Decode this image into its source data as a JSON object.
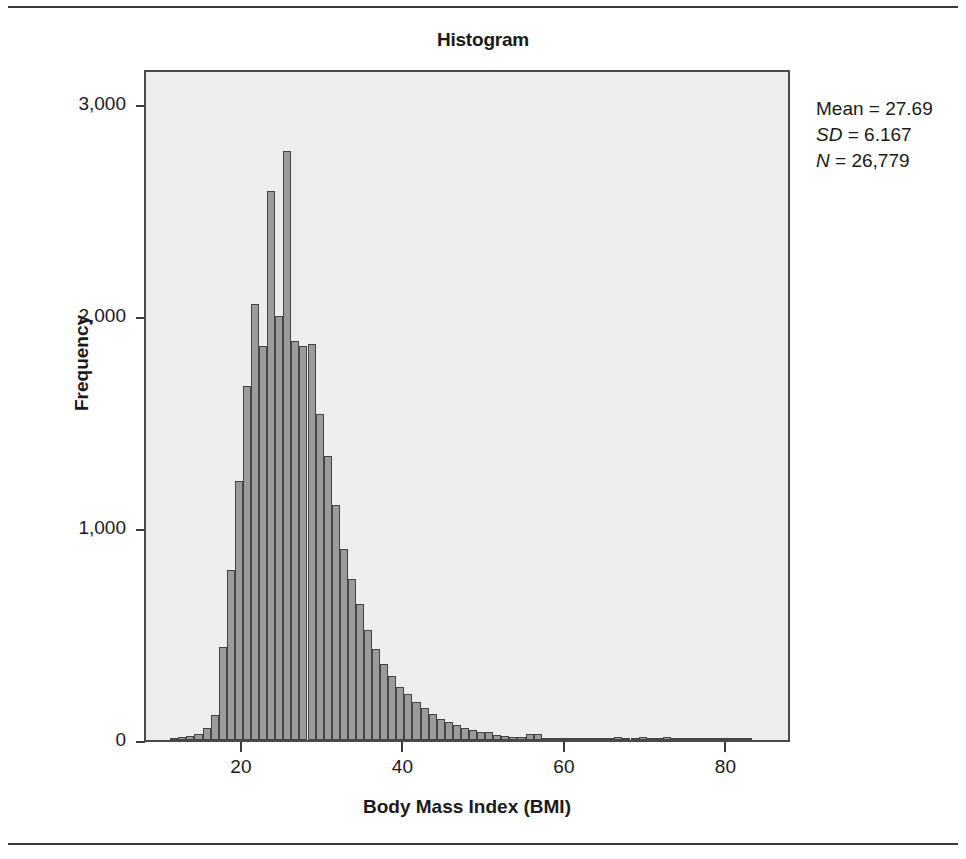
{
  "chart": {
    "title": "Histogram",
    "xlabel": "Body Mass Index (BMI)",
    "ylabel": "Frequency",
    "y_ticks": [
      "0",
      "1,000",
      "2,000",
      "3,000"
    ],
    "x_ticks": [
      "20",
      "40",
      "60",
      "80"
    ]
  },
  "stats": {
    "mean_label": "Mean",
    "mean_value": "27.69",
    "sd_label": "SD",
    "sd_value": "6.167",
    "n_label": "N",
    "n_value": "26,779",
    "equals": "="
  },
  "colors": {
    "bar_fill": "#9b9b9b",
    "bar_border": "#444444",
    "plot_background": "#ededed",
    "frame": "#4a4a4a",
    "text": "#1a1a1a"
  },
  "chart_data": {
    "type": "bar",
    "title": "Histogram",
    "xlabel": "Body Mass Index (BMI)",
    "ylabel": "Frequency",
    "xlim": [
      8,
      88
    ],
    "ylim": [
      0,
      3170
    ],
    "grid": false,
    "legend": null,
    "bin_width": 1,
    "annotations": [
      "Mean = 27.69",
      "SD = 6.167",
      "N = 26,779"
    ],
    "categories": [
      11,
      12,
      13,
      14,
      15,
      16,
      17,
      18,
      19,
      20,
      21,
      22,
      23,
      24,
      25,
      26,
      27,
      28,
      29,
      30,
      31,
      32,
      33,
      34,
      35,
      36,
      37,
      38,
      39,
      40,
      41,
      42,
      43,
      44,
      45,
      46,
      47,
      48,
      49,
      50,
      51,
      52,
      53,
      54,
      55,
      56,
      57,
      58,
      59,
      60,
      61,
      62,
      63,
      64,
      65,
      66,
      67,
      68,
      69,
      70,
      71,
      72,
      73,
      74,
      75,
      76,
      77,
      78,
      79,
      80,
      81,
      82
    ],
    "values": [
      10,
      14,
      20,
      30,
      55,
      120,
      440,
      800,
      1220,
      1670,
      2055,
      1860,
      2590,
      2000,
      2780,
      1880,
      1860,
      1870,
      1540,
      1340,
      1110,
      900,
      760,
      640,
      520,
      430,
      360,
      300,
      250,
      215,
      180,
      150,
      125,
      100,
      85,
      70,
      58,
      48,
      40,
      40,
      22,
      18,
      15,
      14,
      30,
      28,
      10,
      9,
      8,
      8,
      7,
      6,
      6,
      5,
      5,
      14,
      4,
      4,
      12,
      3,
      3,
      12,
      3,
      3,
      3,
      2,
      10,
      2,
      2,
      10,
      2,
      2
    ]
  }
}
